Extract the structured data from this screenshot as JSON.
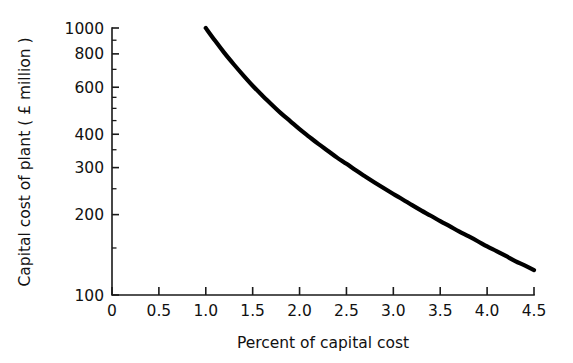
{
  "chart_data": {
    "type": "line",
    "title": "",
    "xlabel": "Percent of capital cost",
    "ylabel": "Capital cost of plant ( £ million )",
    "xscale": "linear",
    "yscale": "log",
    "xlim": [
      0,
      4.5
    ],
    "ylim": [
      100,
      1000
    ],
    "grid": false,
    "legend": false,
    "xticks": [
      0,
      0.5,
      1.0,
      1.5,
      2.0,
      2.5,
      3.0,
      3.5,
      4.0,
      4.5
    ],
    "xticklabels": [
      "0",
      "0.5",
      "1.0",
      "1.5",
      "2.0",
      "2.5",
      "3.0",
      "3.5",
      "4.0",
      "4.5"
    ],
    "yticks": [
      100,
      200,
      300,
      400,
      600,
      800,
      1000
    ],
    "yticklabels": [
      "100",
      "200",
      "300",
      "400",
      "600",
      "800",
      "1000"
    ],
    "yminorticks": [
      150,
      250,
      350,
      450,
      500,
      550,
      700,
      900
    ],
    "series": [
      {
        "name": "capital cost of plant",
        "color": "#000000",
        "linewidth": 4.2,
        "x": [
          1.0,
          1.1,
          1.2,
          1.3,
          1.4,
          1.5,
          1.6,
          1.7,
          1.8,
          1.9,
          2.0,
          2.1,
          2.2,
          2.3,
          2.4,
          2.5,
          2.6,
          2.7,
          2.8,
          2.9,
          3.0,
          3.1,
          3.2,
          3.3,
          3.4,
          3.5,
          3.6,
          3.7,
          3.8,
          3.9,
          4.0,
          4.1,
          4.2,
          4.3,
          4.4,
          4.5
        ],
        "y": [
          1000,
          895,
          805,
          730,
          665,
          608,
          560,
          518,
          480,
          448,
          418,
          392,
          368,
          347,
          327,
          310,
          293,
          278,
          264,
          251,
          239,
          228,
          217,
          207,
          198,
          189,
          181,
          173,
          166,
          159,
          152,
          146,
          140,
          134,
          129,
          124
        ]
      }
    ]
  },
  "geometry": {
    "plot_left_px": 112,
    "plot_right_px": 534,
    "plot_top_px": 28,
    "plot_bottom_px": 295
  }
}
